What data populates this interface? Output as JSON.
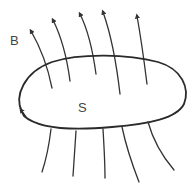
{
  "diagram": {
    "type": "magnetic-flux-through-surface",
    "labels": {
      "field": "B",
      "surface": "S"
    },
    "colors": {
      "stroke": "#333333",
      "text": "#444444",
      "background": "#ffffff"
    },
    "field_lines_above": 5,
    "field_lines_below": 5,
    "loop_orientation_arrow": "counterclockwise (left side, pointing up)"
  }
}
